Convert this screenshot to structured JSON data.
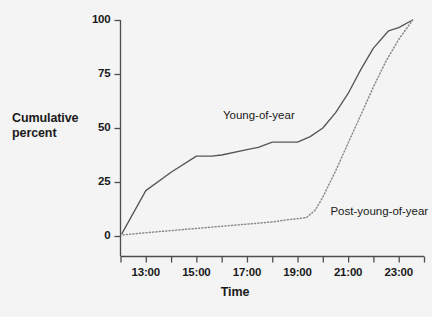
{
  "chart_data": {
    "type": "line",
    "title": "",
    "xlabel": "Time",
    "ylabel": "Cumulative percent",
    "ylabel_lines": [
      "Cumulative",
      "percent"
    ],
    "ylim": [
      0,
      100
    ],
    "yticks": [
      0,
      25,
      50,
      75,
      100
    ],
    "ytick_labels": [
      "0",
      "25",
      "50",
      "75",
      "100"
    ],
    "xlim_hours": [
      12.0,
      24.0
    ],
    "xticks_hours": [
      13,
      15,
      17,
      19,
      21,
      23
    ],
    "xtick_labels": [
      "13:00",
      "15:00",
      "17:00",
      "19:00",
      "21:00",
      "23:00"
    ],
    "x_minor_ticks_hours": [
      12,
      14,
      16,
      18,
      20,
      22,
      24
    ],
    "grid": false,
    "legend_position": "inline-annotation",
    "series": [
      {
        "name": "Young-of-year",
        "style": "solid",
        "color": "#555555",
        "label_x_hour": 16.05,
        "label_y_percent": 55,
        "x_hours": [
          12.05,
          13.0,
          14.0,
          15.0,
          15.6,
          16.0,
          17.0,
          17.45,
          18.0,
          19.0,
          19.5,
          20.0,
          20.5,
          21.0,
          21.5,
          22.0,
          22.6,
          23.0,
          23.55
        ],
        "values": [
          1,
          21,
          29.5,
          37,
          37,
          37.5,
          40,
          41,
          43.5,
          43.5,
          46,
          50,
          57,
          66,
          77,
          87,
          95,
          96.5,
          100
        ]
      },
      {
        "name": "Post-young-of-year",
        "style": "dotted",
        "color": "#8a8a8a",
        "label_x_hour": 20.3,
        "label_y_percent": 10.5,
        "x_hours": [
          12.1,
          13.0,
          14.0,
          15.0,
          16.0,
          17.0,
          18.0,
          18.6,
          19.0,
          19.35,
          19.7,
          20.0,
          20.5,
          21.0,
          21.5,
          22.0,
          22.5,
          23.0,
          23.55
        ],
        "values": [
          0.5,
          1.5,
          2.5,
          3.5,
          4.5,
          5.5,
          6.5,
          7.5,
          8,
          8.5,
          12,
          18,
          30,
          43,
          56,
          69,
          81,
          91,
          100
        ]
      }
    ],
    "colors": {
      "background": "#f4f4f4",
      "axis": "#4d4d4d",
      "text": "#1a1a1a",
      "series_solid": "#555555",
      "series_dotted": "#8a8a8a"
    }
  }
}
